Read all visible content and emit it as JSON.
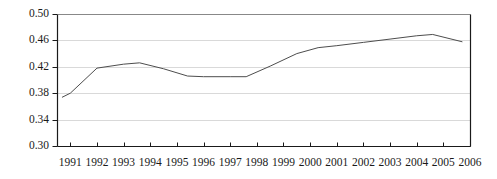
{
  "chart_data": {
    "type": "line",
    "title": "",
    "subtitle": "",
    "xlabel": "",
    "ylabel": "",
    "xlim": [
      1990.5,
      2006.0
    ],
    "ylim": [
      0.3,
      0.5
    ],
    "ytick_labels": [
      "0.50",
      "0.46",
      "0.42",
      "0.38",
      "0.34",
      "0.30"
    ],
    "ytick_values": [
      0.5,
      0.46,
      0.42,
      0.38,
      0.34,
      0.3
    ],
    "xtick_labels": [
      "1991",
      "1992",
      "1993",
      "1994",
      "1995",
      "1996",
      "1997",
      "1998",
      "1999",
      "2000",
      "2001",
      "2002",
      "2003",
      "2004",
      "2005",
      "2006"
    ],
    "xtick_values": [
      1991,
      1992,
      1993,
      1994,
      1995,
      1996,
      1997,
      1998,
      1999,
      2000,
      2001,
      2002,
      2003,
      2004,
      2005,
      2006
    ],
    "grid": true,
    "grid_axis": "y",
    "legend": false,
    "legend_position": "none",
    "series": [
      {
        "name": "series-1",
        "color": "#4d4d4d",
        "x": [
          1990.7,
          1991.0,
          1992.0,
          1993.0,
          1993.6,
          1994.5,
          1995.4,
          1996.0,
          1997.0,
          1997.6,
          1998.5,
          1999.5,
          2000.3,
          2001.0,
          2002.0,
          2003.0,
          2004.0,
          2004.6,
          2005.7
        ],
        "values": [
          0.374,
          0.38,
          0.418,
          0.424,
          0.426,
          0.417,
          0.406,
          0.405,
          0.405,
          0.405,
          0.421,
          0.44,
          0.449,
          0.452,
          0.457,
          0.462,
          0.467,
          0.469,
          0.458
        ]
      }
    ],
    "colors": {
      "line": "#4d4d4d",
      "axis": "#1a1a1a",
      "grid": "#d9d9d9",
      "text": "#1a1a1a",
      "background": "#ffffff"
    },
    "geometry": {
      "plot_left": 57,
      "plot_right": 470,
      "plot_top": 14,
      "plot_bottom": 146
    }
  }
}
